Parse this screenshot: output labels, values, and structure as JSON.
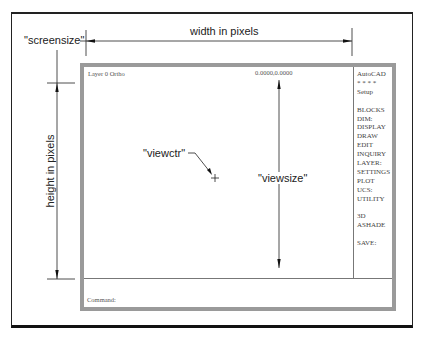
{
  "diagram": {
    "labels": {
      "screensize": "\"screensize\"",
      "width": "width in pixels",
      "height": "height in pixels",
      "viewctr": "\"viewctr\"",
      "viewsize": "\"viewsize\""
    }
  },
  "screen": {
    "status_left": "Layer 0 Ortho",
    "status_right": "0.0000,0.0000",
    "command_prompt": "Command:",
    "menu": {
      "title": "AutoCAD",
      "stars": "* * * *",
      "setup": "Setup",
      "items": [
        "BLOCKS",
        "DIM:",
        "DISPLAY",
        "DRAW",
        "EDIT",
        "INQUIRY",
        "LAYER:",
        "SETTINGS",
        "PLOT",
        "UCS:",
        "UTILITY"
      ],
      "items2": [
        "3D",
        "ASHADE"
      ],
      "save": "SAVE:"
    }
  },
  "colors": {
    "frame_gray": "#9a9a9a",
    "line": "#222222"
  }
}
